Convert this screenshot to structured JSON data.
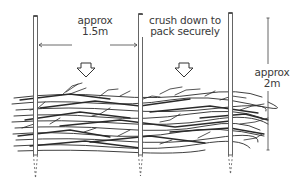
{
  "diagram": {
    "stakes": [
      {
        "x": 36,
        "top": 16,
        "ground": 155,
        "bottom_dashed": 178
      },
      {
        "x": 141,
        "top": 14,
        "ground": 155,
        "bottom_dashed": 176
      },
      {
        "x": 230,
        "top": 13,
        "ground": 155,
        "bottom_dashed": 174
      }
    ],
    "labels": {
      "width_line1": "approx",
      "width_line2": "1.5m",
      "crush_line1": "crush down to",
      "crush_line2": "pack securely",
      "height_line1": "approx",
      "height_line2": "2m"
    },
    "arrows": [
      {
        "name": "down-arrow-left",
        "x": 86,
        "y": 63
      },
      {
        "name": "down-arrow-right",
        "x": 184,
        "y": 63
      }
    ],
    "dimensions": {
      "width_span": "approx 1.5m",
      "height_span": "approx 2m"
    },
    "colors": {
      "line": "#2a2a2a",
      "stake": "#555555",
      "text": "#3a3a3a",
      "background": "#ffffff"
    }
  }
}
